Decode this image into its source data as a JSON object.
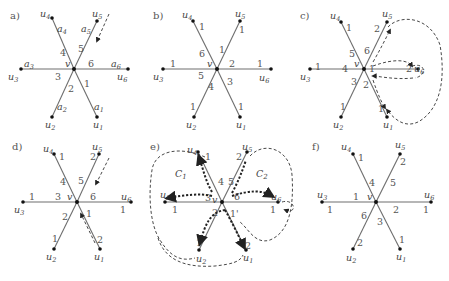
{
  "panels": [
    {
      "id": "a",
      "label": "a)",
      "center_label": "v",
      "nodes": [
        "u1",
        "u2",
        "u3",
        "u4",
        "u5",
        "u6"
      ],
      "near_center_labels": {
        "e1": "1",
        "e2": "2",
        "e3": "3",
        "e4": "4",
        "e5": "5",
        "e6": "6"
      },
      "far_labels": {
        "e1": "a1",
        "e2": "a2",
        "e3": "a3",
        "e4": "a4",
        "e5": "a5",
        "e6": "a6"
      },
      "annotations": [
        "dashed arrow toward u5 edge"
      ]
    },
    {
      "id": "b",
      "label": "b)",
      "center_label": "v",
      "nodes": [
        "u1",
        "u2",
        "u3",
        "u4",
        "u5",
        "u6"
      ],
      "near_center_labels": {
        "e1": "3",
        "e2": "4",
        "e3": "5",
        "e4": "6",
        "e5": "1",
        "e6": "2"
      },
      "far_labels": {
        "e1": "1",
        "e2": "1",
        "e3": "1",
        "e4": "1",
        "e5": "1",
        "e6": "1"
      }
    },
    {
      "id": "c",
      "label": "c)",
      "center_label": "v",
      "nodes": [
        "u1",
        "u2",
        "u3",
        "u4",
        "u5",
        "u6"
      ],
      "near_center_labels": {
        "e1": "2",
        "e2": "3",
        "e3": "4",
        "e4": "5",
        "e5": "6",
        "e6": "1"
      },
      "far_labels": {
        "e1": "1",
        "e2": "1",
        "e3": "1",
        "e4": "1",
        "e5": "2",
        "e6": "2"
      },
      "annotations": [
        "dashed loop around u6 and u1",
        "dashed loop from u5 to u1"
      ]
    },
    {
      "id": "d",
      "label": "d)",
      "center_label": "v",
      "nodes": [
        "u1",
        "u2",
        "u3",
        "u4",
        "u5",
        "u6"
      ],
      "near_center_labels": {
        "e1": "1",
        "e2": "2",
        "e3": "3",
        "e4": "4",
        "e5": "5",
        "e6": "6"
      },
      "far_labels": {
        "e1": "2",
        "e2": "1",
        "e3": "1",
        "e4": "1",
        "e5": "2",
        "e6": "1"
      },
      "annotations": [
        "dashed arrow toward u5 edge",
        "dashed arrow along u1 edge toward v"
      ]
    },
    {
      "id": "e",
      "label": "e)",
      "center_label": "v",
      "nodes": [
        "u1",
        "u2",
        "u3",
        "u4",
        "u5",
        "u6"
      ],
      "near_center_labels": {
        "e1": "1'",
        "e2": "2",
        "e3": "3",
        "e4": "4",
        "e5": "5",
        "e6": "6"
      },
      "far_labels": {
        "e1": "2",
        "e2": "1",
        "e3": "1",
        "e4": "1",
        "e5": "2",
        "e6": "1"
      },
      "cycles": [
        "C1",
        "C2"
      ],
      "annotations": [
        "dashed cycles C1 and C2",
        "bold dashed paths"
      ]
    },
    {
      "id": "f",
      "label": "f)",
      "center_label": "v",
      "nodes": [
        "u1",
        "u2",
        "u3",
        "u4",
        "u5",
        "u6"
      ],
      "near_center_labels": {
        "e1": "3",
        "e2": "6",
        "e3": "1",
        "e4": "4",
        "e5": "5",
        "e6": "2"
      },
      "far_labels": {
        "e1": "1",
        "e2": "2",
        "e3": "1",
        "e4": "1",
        "e5": "2",
        "e6": "1"
      }
    }
  ]
}
